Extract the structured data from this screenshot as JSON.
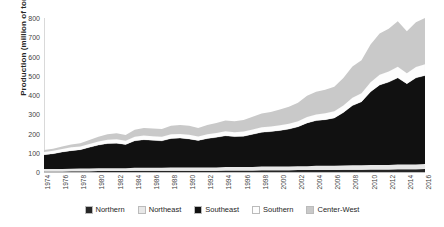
{
  "chart_data": {
    "type": "area",
    "stacked": true,
    "title": "",
    "xlabel": "",
    "ylabel": "Production (million of ton)",
    "ylim": [
      0,
      800
    ],
    "ytick_step": 100,
    "yticks": [
      "800",
      "700",
      "600",
      "500",
      "400",
      "300",
      "200",
      "100",
      "0"
    ],
    "grid": false,
    "legend_position": "bottom",
    "x": [
      1974,
      1975,
      1976,
      1977,
      1978,
      1979,
      1980,
      1981,
      1982,
      1983,
      1984,
      1985,
      1986,
      1987,
      1988,
      1989,
      1990,
      1991,
      1992,
      1993,
      1994,
      1995,
      1996,
      1997,
      1998,
      1999,
      2000,
      2001,
      2002,
      2003,
      2004,
      2005,
      2006,
      2007,
      2008,
      2009,
      2010,
      2011,
      2012,
      2013,
      2014,
      2015,
      2016
    ],
    "xtick_labels": [
      "1974",
      "1976",
      "1978",
      "1980",
      "1982",
      "1984",
      "1986",
      "1988",
      "1990",
      "1992",
      "1994",
      "1996",
      "1998",
      "2000",
      "2002",
      "2004",
      "2006",
      "2008",
      "2010",
      "2012",
      "2014",
      "2016"
    ],
    "series": [
      {
        "name": "Northern",
        "color": "#262626",
        "values": [
          3,
          3,
          3,
          4,
          4,
          4,
          5,
          5,
          5,
          5,
          6,
          6,
          6,
          6,
          7,
          7,
          7,
          7,
          7,
          7,
          8,
          8,
          8,
          8,
          9,
          9,
          9,
          9,
          10,
          10,
          11,
          11,
          11,
          12,
          12,
          12,
          13,
          13,
          13,
          14,
          14,
          14,
          15
        ]
      },
      {
        "name": "Northeast",
        "color": "#e8e8e8",
        "values": [
          12,
          12,
          13,
          13,
          14,
          14,
          15,
          15,
          15,
          14,
          16,
          16,
          16,
          16,
          17,
          17,
          17,
          17,
          17,
          17,
          18,
          18,
          18,
          18,
          19,
          19,
          19,
          19,
          20,
          20,
          21,
          21,
          22,
          22,
          23,
          23,
          24,
          24,
          24,
          25,
          25,
          25,
          26
        ]
      },
      {
        "name": "Southeast",
        "color": "#111111",
        "values": [
          75,
          80,
          88,
          94,
          98,
          110,
          120,
          128,
          130,
          124,
          140,
          146,
          143,
          140,
          150,
          152,
          148,
          140,
          150,
          156,
          162,
          158,
          160,
          170,
          178,
          182,
          188,
          195,
          205,
          225,
          235,
          240,
          248,
          275,
          310,
          330,
          380,
          415,
          430,
          450,
          420,
          450,
          460
        ]
      },
      {
        "name": "Southern",
        "color": "#fdfdfd",
        "values": [
          14,
          15,
          16,
          17,
          17,
          18,
          19,
          20,
          20,
          19,
          21,
          21,
          21,
          21,
          22,
          22,
          22,
          21,
          22,
          23,
          24,
          23,
          24,
          25,
          26,
          26,
          27,
          28,
          29,
          31,
          32,
          33,
          34,
          37,
          41,
          44,
          49,
          53,
          55,
          58,
          54,
          57,
          59
        ]
      },
      {
        "name": "Center-West",
        "color": "#c9c9c9",
        "values": [
          10,
          11,
          13,
          15,
          17,
          20,
          24,
          28,
          31,
          30,
          36,
          39,
          40,
          40,
          44,
          46,
          46,
          44,
          48,
          52,
          56,
          56,
          60,
          66,
          72,
          76,
          82,
          88,
          96,
          110,
          118,
          122,
          128,
          142,
          162,
          172,
          196,
          214,
          222,
          236,
          218,
          232,
          240
        ]
      }
    ]
  },
  "legend": {
    "items": [
      {
        "label": "Northern",
        "color": "#262626"
      },
      {
        "label": "Northeast",
        "color": "#e8e8e8"
      },
      {
        "label": "Southeast",
        "color": "#111111"
      },
      {
        "label": "Southern",
        "color": "#fdfdfd"
      },
      {
        "label": "Center-West",
        "color": "#c9c9c9"
      }
    ]
  }
}
